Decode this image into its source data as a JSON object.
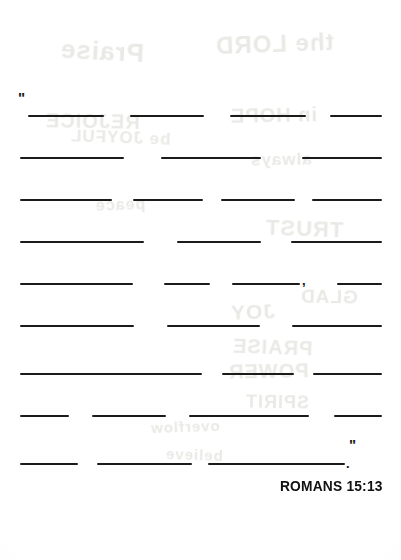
{
  "document": {
    "kind": "fill-in-the-blank scripture memory worksheet",
    "attribution": "ROMANS 15:13",
    "quote_open": "\"",
    "quote_close": "\"",
    "ink_color": "#1b1b1b",
    "paper_color": "#fefefe"
  },
  "punctuation": {
    "comma": ",",
    "period": "."
  },
  "showthrough": {
    "note": "faint mirrored bleed-through of handwriting from the reverse side of the page",
    "fragments": [
      {
        "text": "Praise",
        "x": 60,
        "y": 36,
        "size": 26,
        "rotate": -3
      },
      {
        "text": "the LORD",
        "x": 215,
        "y": 30,
        "size": 24,
        "rotate": 2
      },
      {
        "text": "REJOICE",
        "x": 45,
        "y": 110,
        "size": 20,
        "rotate": -1
      },
      {
        "text": "in HOPE",
        "x": 230,
        "y": 104,
        "size": 20,
        "rotate": 1
      },
      {
        "text": "be JOYFUL",
        "x": 70,
        "y": 128,
        "size": 17,
        "rotate": -2
      },
      {
        "text": "always",
        "x": 250,
        "y": 150,
        "size": 17,
        "rotate": 1
      },
      {
        "text": "TRUST",
        "x": 265,
        "y": 216,
        "size": 22,
        "rotate": -2
      },
      {
        "text": "peace",
        "x": 95,
        "y": 196,
        "size": 16,
        "rotate": 2
      },
      {
        "text": "GLAD",
        "x": 300,
        "y": 286,
        "size": 19,
        "rotate": -1
      },
      {
        "text": "JOY",
        "x": 230,
        "y": 300,
        "size": 21,
        "rotate": 2
      },
      {
        "text": "PRAISE",
        "x": 232,
        "y": 336,
        "size": 20,
        "rotate": -2
      },
      {
        "text": "POWER",
        "x": 228,
        "y": 360,
        "size": 20,
        "rotate": 1
      },
      {
        "text": "SPIRIT",
        "x": 245,
        "y": 392,
        "size": 18,
        "rotate": -1
      },
      {
        "text": "overflow",
        "x": 150,
        "y": 418,
        "size": 15,
        "rotate": 2
      },
      {
        "text": "believe",
        "x": 165,
        "y": 446,
        "size": 15,
        "rotate": -2
      }
    ]
  },
  "rows": [
    {
      "index": 1,
      "y": 115,
      "blanks": [
        {
          "x": 28,
          "width": 76
        },
        {
          "x": 130,
          "width": 74
        },
        {
          "x": 230,
          "width": 76
        },
        {
          "x": 330,
          "width": 52
        }
      ],
      "marks": []
    },
    {
      "index": 2,
      "y": 157,
      "blanks": [
        {
          "x": 20,
          "width": 104
        },
        {
          "x": 161,
          "width": 100
        },
        {
          "x": 302,
          "width": 80
        }
      ],
      "marks": []
    },
    {
      "index": 3,
      "y": 199,
      "blanks": [
        {
          "x": 20,
          "width": 92
        },
        {
          "x": 133,
          "width": 70
        },
        {
          "x": 221,
          "width": 74
        },
        {
          "x": 312,
          "width": 70
        }
      ],
      "marks": []
    },
    {
      "index": 4,
      "y": 241,
      "blanks": [
        {
          "x": 20,
          "width": 124
        },
        {
          "x": 177,
          "width": 84
        },
        {
          "x": 291,
          "width": 91
        }
      ],
      "marks": []
    },
    {
      "index": 5,
      "y": 283,
      "blanks": [
        {
          "x": 20,
          "width": 113
        },
        {
          "x": 164,
          "width": 46
        },
        {
          "x": 232,
          "width": 68
        },
        {
          "x": 337,
          "width": 45
        }
      ],
      "marks": [
        {
          "type": "comma",
          "x": 302,
          "y": -9
        }
      ]
    },
    {
      "index": 6,
      "y": 325,
      "blanks": [
        {
          "x": 20,
          "width": 114
        },
        {
          "x": 167,
          "width": 93
        },
        {
          "x": 292,
          "width": 90
        }
      ],
      "marks": []
    },
    {
      "index": 7,
      "y": 373,
      "blanks": [
        {
          "x": 20,
          "width": 182
        },
        {
          "x": 222,
          "width": 72
        },
        {
          "x": 313,
          "width": 69
        }
      ],
      "marks": []
    },
    {
      "index": 8,
      "y": 415,
      "blanks": [
        {
          "x": 20,
          "width": 49
        },
        {
          "x": 92,
          "width": 74
        },
        {
          "x": 189,
          "width": 120
        },
        {
          "x": 334,
          "width": 48
        }
      ],
      "marks": []
    },
    {
      "index": 9,
      "y": 463,
      "blanks": [
        {
          "x": 20,
          "width": 58
        },
        {
          "x": 97,
          "width": 95
        },
        {
          "x": 208,
          "width": 137
        }
      ],
      "marks": [
        {
          "type": "period",
          "x": 346,
          "y": -6
        }
      ]
    }
  ]
}
